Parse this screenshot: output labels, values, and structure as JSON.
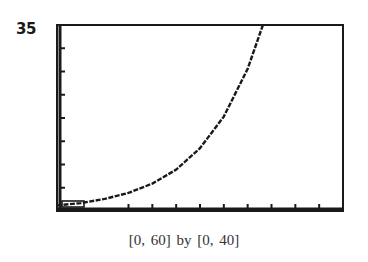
{
  "chart_data": {
    "type": "line",
    "title": "",
    "xlabel": "",
    "ylabel": "",
    "xlim": [
      0,
      60
    ],
    "ylim": [
      0,
      40
    ],
    "x_ticks_scale": 5,
    "y_ticks_scale": 5,
    "grid": false,
    "legend": null,
    "annotations": [
      "35"
    ],
    "caption": "[0, 60]  by  [0, 40]",
    "series": [
      {
        "name": "y ≈ 1.15·e^(0.082x)",
        "x": [
          0,
          5,
          10,
          15,
          20,
          25,
          30,
          35,
          40,
          43.2
        ],
        "values": [
          1.2,
          1.7,
          2.6,
          3.9,
          5.9,
          8.9,
          13.5,
          20.3,
          30.6,
          40.0
        ]
      }
    ]
  },
  "labels": {
    "ymax": "35",
    "caption": "[0, 60]  by  [0, 40]"
  },
  "colors": {
    "frame": "#1a1a1a",
    "curve": "#1a1a1a",
    "background": "#ffffff"
  }
}
